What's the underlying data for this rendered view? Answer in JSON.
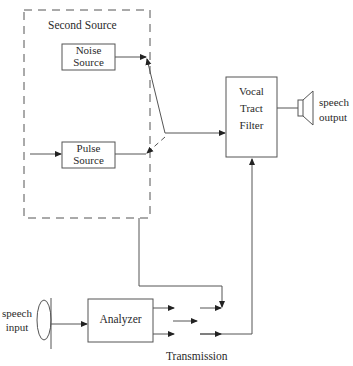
{
  "diagram": {
    "second_source": {
      "label": "Second Source"
    },
    "noise_source": {
      "line1": "Noise",
      "line2": "Source"
    },
    "pulse_source": {
      "line1": "Pulse",
      "line2": "Source"
    },
    "vocal_tract_filter": {
      "line1": "Vocal",
      "line2": "Tract",
      "line3": "Filter"
    },
    "analyzer": {
      "label": "Analyzer"
    },
    "speech_output": {
      "line1": "speech",
      "line2": "output"
    },
    "speech_input": {
      "line1": "speech",
      "line2": "input"
    },
    "transmission": {
      "label": "Transmission"
    },
    "colors": {
      "stroke": "#444444",
      "background": "#ffffff"
    }
  }
}
